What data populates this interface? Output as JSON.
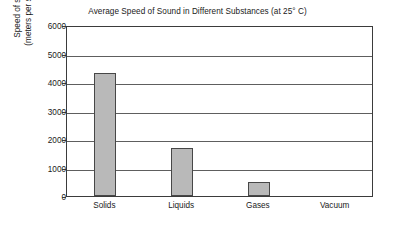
{
  "chart_data": {
    "type": "bar",
    "title": "Average Speed of Sound in Different Substances (at 25° C)",
    "xlabel": "",
    "ylabel": "Speed of sound (meters per second)",
    "ylabel_lines": [
      "Speed of sound",
      "(meters per second)"
    ],
    "categories": [
      "Solids",
      "Liquids",
      "Gases",
      "Vacuum"
    ],
    "values": [
      4300,
      1700,
      500,
      0
    ],
    "ylim": [
      0,
      6000
    ],
    "ytick_values": [
      0,
      1000,
      2000,
      3000,
      4000,
      5000,
      6000
    ],
    "yticks": [
      "0",
      "1000",
      "2000",
      "3000",
      "4000",
      "5000",
      "6000"
    ],
    "grid": true,
    "grid_axis": "y",
    "legend": false,
    "legend_position": "none",
    "bar_fill_color": "#b9b9b9",
    "bar_edge_color": "#474747",
    "axis_color": "#3b3b3b",
    "grid_color": "#5e5e5e",
    "background_color": "#ffffff"
  }
}
